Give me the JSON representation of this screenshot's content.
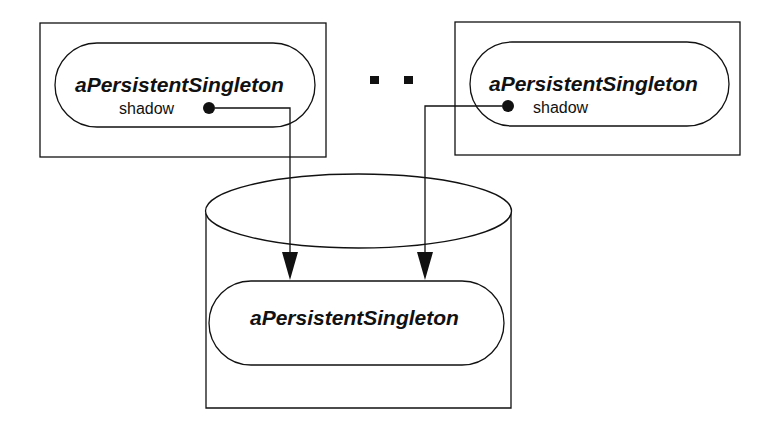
{
  "diagram": {
    "left_process": {
      "object_name": "aPersistentSingleton",
      "attribute": "shadow"
    },
    "ellipsis": "..",
    "right_process": {
      "object_name": "aPersistentSingleton",
      "attribute": "shadow"
    },
    "database": {
      "object_name": "aPersistentSingleton"
    },
    "colors": {
      "stroke": "#111111",
      "background": "#ffffff"
    }
  }
}
